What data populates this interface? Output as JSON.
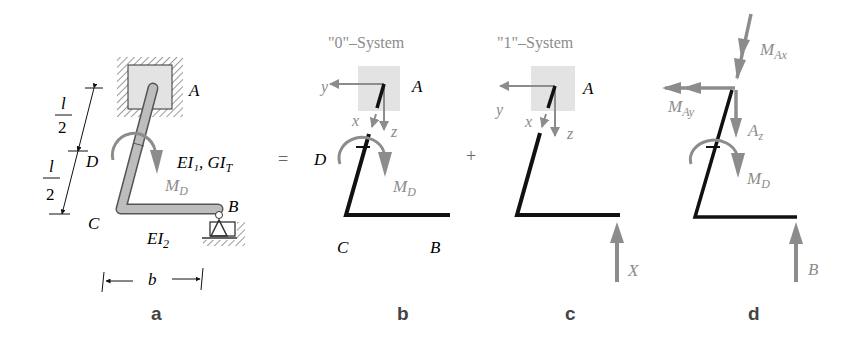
{
  "colors": {
    "beam": "#111111",
    "gray": "#8c8c8c",
    "support": "#e3e3e3",
    "label": "#222222"
  },
  "panel_a": {
    "label": "a",
    "point_A": "A",
    "point_B": "B",
    "point_C": "C",
    "point_D": "D",
    "stiffness_1": "EI₁, GI",
    "stiffness_1_sub": "T",
    "stiffness_2": "EI",
    "stiffness_2_sub": "2",
    "moment": "M",
    "moment_sub": "D",
    "dim_l_num": "l",
    "dim_l_den": "2",
    "dim_b": "b"
  },
  "operators": {
    "equals": "=",
    "plus": "+"
  },
  "panel_b": {
    "title": "\"0\"–System",
    "label": "b",
    "point_A": "A",
    "point_B": "B",
    "point_C": "C",
    "point_D": "D",
    "axis_x": "x",
    "axis_y": "y",
    "axis_z": "z",
    "moment": "M",
    "moment_sub": "D"
  },
  "panel_c": {
    "title": "\"1\"–System",
    "label": "c",
    "point_A": "A",
    "axis_x": "x",
    "axis_y": "y",
    "axis_z": "z",
    "force": "X"
  },
  "panel_d": {
    "label": "d",
    "moment_Ax": "M",
    "moment_Ax_sub": "Ax",
    "moment_Ay": "M",
    "moment_Ay_sub": "Ay",
    "force_Az": "A",
    "force_Az_sub": "z",
    "moment_D": "M",
    "moment_D_sub": "D",
    "force_B": "B"
  }
}
